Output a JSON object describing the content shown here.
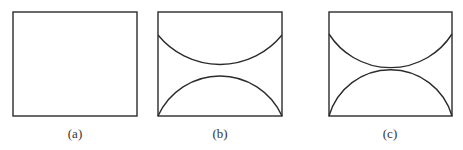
{
  "figure": {
    "stroke_color": "#2b2b2b",
    "panels": [
      {
        "id": "a",
        "label": "(a)",
        "description": "Empty rectangle",
        "rect": {
          "x": 13,
          "y": 12,
          "w": 124,
          "h": 104
        }
      },
      {
        "id": "b",
        "label": "(b)",
        "description": "Rectangle with upper arc (concave up) and lower arc (concave down) separated by a gap",
        "rect": {
          "x": 158,
          "y": 12,
          "w": 124,
          "h": 104
        },
        "upper_arc": {
          "start_y": 35,
          "min_y": 68.5
        },
        "lower_arc": {
          "start_y": 116,
          "max_y": 78
        }
      },
      {
        "id": "c",
        "label": "(c)",
        "description": "Rectangle with upper and lower arcs tangent at center",
        "rect": {
          "x": 329,
          "y": 12,
          "w": 123,
          "h": 104
        },
        "upper_arc": {
          "start_y": 34,
          "min_y": 69
        },
        "lower_arc": {
          "start_y": 116,
          "max_y": 69
        }
      }
    ]
  }
}
